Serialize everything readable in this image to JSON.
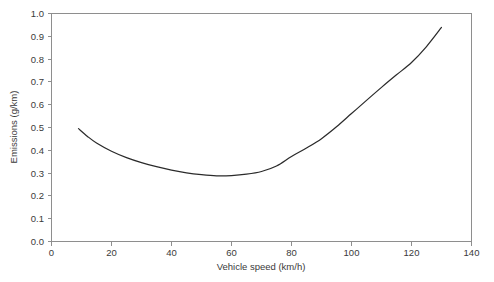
{
  "chart_data": {
    "type": "line",
    "title": "",
    "subtitle": "",
    "xlabel": "Vehicle speed (km/h)",
    "ylabel": "Emissions (g/km)",
    "xlim": [
      0,
      140
    ],
    "ylim": [
      0.0,
      1.0
    ],
    "grid": false,
    "legend": null,
    "legend_position": "none",
    "xticks": [
      0,
      20,
      40,
      60,
      80,
      100,
      120,
      140
    ],
    "xtick_labels": [
      "0",
      "20",
      "40",
      "60",
      "80",
      "100",
      "120",
      "140"
    ],
    "yticks": [
      0.0,
      0.1,
      0.2,
      0.3,
      0.4,
      0.5,
      0.6,
      0.7,
      0.8,
      0.9,
      1.0
    ],
    "ytick_labels": [
      "0.0",
      "0.1",
      "0.2",
      "0.3",
      "0.4",
      "0.5",
      "0.6",
      "0.7",
      "0.8",
      "0.9",
      "1.0"
    ],
    "series": [
      {
        "name": "Emissions vs vehicle speed",
        "color": "#2b2b2b",
        "x": [
          9,
          12,
          15,
          20,
          25,
          30,
          35,
          40,
          45,
          50,
          55,
          60,
          65,
          70,
          75,
          80,
          85,
          90,
          95,
          100,
          105,
          110,
          115,
          120,
          125,
          130
        ],
        "values": [
          0.495,
          0.461,
          0.432,
          0.396,
          0.368,
          0.346,
          0.328,
          0.313,
          0.301,
          0.293,
          0.288,
          0.289,
          0.295,
          0.307,
          0.331,
          0.373,
          0.41,
          0.451,
          0.503,
          0.561,
          0.619,
          0.676,
          0.731,
          0.785,
          0.855,
          0.939
        ]
      }
    ],
    "annotations": []
  },
  "axes": {
    "x_title": "Vehicle speed (km/h)",
    "y_title": "Emissions (g/km)"
  },
  "ticks": {
    "x": [
      "0",
      "20",
      "40",
      "60",
      "80",
      "100",
      "120",
      "140"
    ],
    "y": [
      "0.0",
      "0.1",
      "0.2",
      "0.3",
      "0.4",
      "0.5",
      "0.6",
      "0.7",
      "0.8",
      "0.9",
      "1.0"
    ]
  },
  "colors": {
    "curve": "#2b2b2b",
    "frame": "#8e8e8e",
    "text": "#3a3a3a",
    "background": "#ffffff"
  }
}
